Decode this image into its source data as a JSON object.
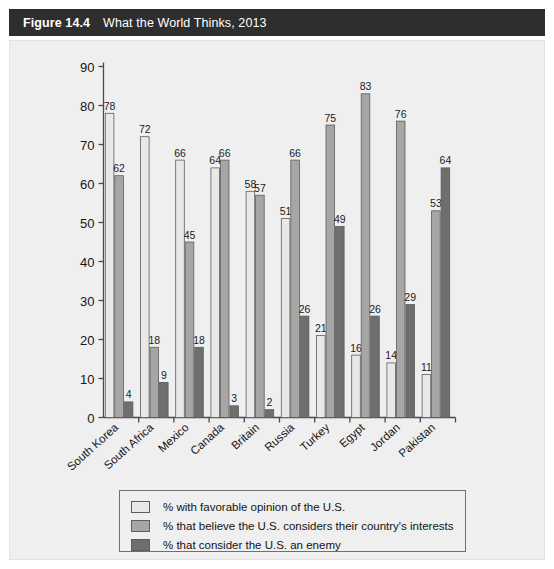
{
  "header": {
    "figure_number": "Figure 14.4",
    "title": "What the World Thinks, 2013"
  },
  "colors": {
    "header_bg": "#2e2e2e",
    "panel_bg": "#efeff0",
    "series_light": "#e8e8e6",
    "series_mid": "#a6a6a4",
    "series_dark": "#6e6e6c",
    "bar_outline": "#5d5d5e",
    "axis": "#4a4a4a"
  },
  "legend": {
    "items": [
      {
        "label": "% with favorable opinion of the U.S.",
        "color": "#e8e8e6"
      },
      {
        "label": "% that believe the U.S. considers their country's interests",
        "color": "#a6a6a4"
      },
      {
        "label": "% that consider the U.S. an enemy",
        "color": "#6e6e6c"
      }
    ]
  },
  "chart_data": {
    "type": "bar",
    "title": "What the World Thinks, 2013",
    "xlabel": "",
    "ylabel": "",
    "ylim": [
      0,
      90
    ],
    "yticks": [
      0,
      10,
      20,
      30,
      40,
      50,
      60,
      70,
      80,
      90
    ],
    "grid": false,
    "legend_position": "bottom",
    "categories": [
      "South Korea",
      "South Africa",
      "Mexico",
      "Canada",
      "Britain",
      "Russia",
      "Turkey",
      "Egypt",
      "Jordan",
      "Pakistan"
    ],
    "series": [
      {
        "name": "% with favorable opinion of the U.S.",
        "color": "#e8e8e6",
        "values": [
          78,
          72,
          66,
          64,
          58,
          51,
          21,
          16,
          14,
          11
        ]
      },
      {
        "name": "% that believe the U.S. considers their country's interests",
        "color": "#a6a6a4",
        "values": [
          62,
          18,
          45,
          66,
          57,
          66,
          75,
          83,
          76,
          53
        ]
      },
      {
        "name": "% that consider the U.S. an enemy",
        "color": "#6e6e6c",
        "values": [
          4,
          9,
          18,
          3,
          2,
          26,
          49,
          26,
          29,
          64
        ]
      }
    ]
  }
}
